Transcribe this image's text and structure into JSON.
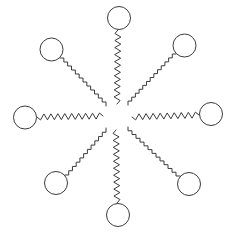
{
  "figure": {
    "background_color": "#ffffff",
    "stroke_color": "#3b3b3b",
    "head_fill_color": "#ffffff",
    "width": 233,
    "height": 235,
    "center_x": 116.5,
    "center_y": 116.5,
    "inner_gap_radius": 14,
    "molecule_count": 8
  },
  "chart_data": {
    "type": "scatter",
    "xlabel": "",
    "ylabel": "",
    "grid": false,
    "legend": "none",
    "xlim": [
      0,
      233
    ],
    "ylim": [
      0,
      235
    ],
    "center": [
      116.5,
      116.5
    ],
    "head_radius": 11.5,
    "zigzag_amplitude": 3,
    "zigzag_period": 7,
    "tail_inner_radius": 14,
    "tail_outer_radius": 88,
    "series": [
      {
        "name": "molecules",
        "angles_deg": [
          270,
          315,
          0,
          45,
          90,
          135,
          180,
          225
        ],
        "head_centers": [
          [
            119,
            18
          ],
          [
            184.5,
            45.5
          ],
          [
            211,
            114
          ],
          [
            189,
            184
          ],
          [
            118,
            215
          ],
          [
            56,
            183
          ],
          [
            25,
            117.5
          ],
          [
            51.5,
            49.5
          ]
        ],
        "tail_start_points": [
          [
            117,
            104
          ],
          [
            107,
            107
          ],
          [
            103,
            116
          ],
          [
            106,
            127
          ],
          [
            116,
            130
          ],
          [
            127,
            127
          ],
          [
            131,
            117
          ],
          [
            127,
            106
          ]
        ]
      }
    ]
  },
  "molecules": [
    {
      "id": "molecule-top",
      "label": "Top molecule",
      "orientation": "vertical-up",
      "angle_deg": 270,
      "head": {
        "cx": 119,
        "cy": 18,
        "r": 11.5
      },
      "tail": {
        "from": [
          118,
          30
        ],
        "to": [
          117,
          104
        ],
        "style": "zigzag"
      }
    },
    {
      "id": "molecule-top-right",
      "label": "Upper-right molecule",
      "orientation": "diagonal-up-right",
      "angle_deg": 315,
      "head": {
        "cx": 184.5,
        "cy": 45.5,
        "r": 11.5
      },
      "tail": {
        "from": [
          176,
          54
        ],
        "to": [
          128,
          105
        ],
        "style": "staircase"
      }
    },
    {
      "id": "molecule-right",
      "label": "Right molecule",
      "orientation": "horizontal-right",
      "angle_deg": 0,
      "head": {
        "cx": 211,
        "cy": 114,
        "r": 11.5
      },
      "tail": {
        "from": [
          199,
          115
        ],
        "to": [
          132,
          117
        ],
        "style": "zigzag"
      }
    },
    {
      "id": "molecule-bottom-right",
      "label": "Lower-right molecule",
      "orientation": "diagonal-down-right",
      "angle_deg": 45,
      "head": {
        "cx": 189,
        "cy": 184,
        "r": 11.5
      },
      "tail": {
        "from": [
          180,
          176
        ],
        "to": [
          128,
          127
        ],
        "style": "staircase"
      }
    },
    {
      "id": "molecule-bottom",
      "label": "Bottom molecule",
      "orientation": "vertical-down",
      "angle_deg": 90,
      "head": {
        "cx": 118,
        "cy": 215,
        "r": 11.5
      },
      "tail": {
        "from": [
          117,
          203
        ],
        "to": [
          116,
          130
        ],
        "style": "zigzag"
      }
    },
    {
      "id": "molecule-bottom-left",
      "label": "Lower-left molecule",
      "orientation": "diagonal-down-left",
      "angle_deg": 135,
      "head": {
        "cx": 56,
        "cy": 183,
        "r": 11.5
      },
      "tail": {
        "from": [
          65,
          175
        ],
        "to": [
          106,
          128
        ],
        "style": "staircase"
      }
    },
    {
      "id": "molecule-left",
      "label": "Left molecule",
      "orientation": "horizontal-left",
      "angle_deg": 180,
      "head": {
        "cx": 25,
        "cy": 117.5,
        "r": 11.5
      },
      "tail": {
        "from": [
          37,
          117
        ],
        "to": [
          103,
          116
        ],
        "style": "zigzag"
      }
    },
    {
      "id": "molecule-top-left",
      "label": "Upper-left molecule",
      "orientation": "diagonal-up-left",
      "angle_deg": 225,
      "head": {
        "cx": 51.5,
        "cy": 49.5,
        "r": 11.5
      },
      "tail": {
        "from": [
          60,
          58
        ],
        "to": [
          106,
          106
        ],
        "style": "staircase"
      }
    }
  ]
}
